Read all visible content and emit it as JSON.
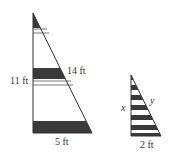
{
  "figure": {
    "large_triangle": {
      "labels": {
        "height": "11 ft",
        "hypotenuse": "14 ft",
        "base": "5 ft"
      },
      "colors": {
        "stroke": "#333333",
        "band": "#3a3a3a"
      }
    },
    "small_triangle": {
      "labels": {
        "height": "x",
        "hypotenuse": "y",
        "base": "2 ft"
      },
      "stripe_count": 6
    }
  }
}
